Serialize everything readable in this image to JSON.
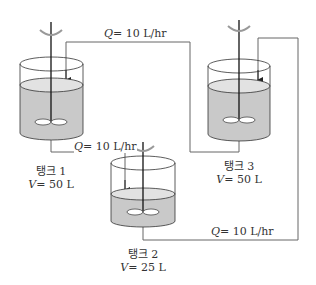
{
  "colors": {
    "liquid": "#c9c9c9",
    "liquid_top": "#e2e2e2",
    "line": "#555555",
    "stroke": "#333333"
  },
  "tanks": [
    {
      "name": "탱크 1",
      "volume_label": "V",
      "volume_value": "= 50 L"
    },
    {
      "name": "탱크 2",
      "volume_label": "V",
      "volume_value": "= 25 L"
    },
    {
      "name": "탱크 3",
      "volume_label": "V",
      "volume_value": "= 50 L"
    }
  ],
  "flows": [
    {
      "symbol": "Q",
      "value": "= 10 L/hr",
      "from": "탱크 1",
      "to": "탱크 3"
    },
    {
      "symbol": "Q",
      "value": "= 10 L/hr",
      "from": "탱크 1",
      "to": "탱크 2"
    },
    {
      "symbol": "Q",
      "value": "= 10 L/hr",
      "from": "탱크 2",
      "to": "탱크 3"
    }
  ]
}
